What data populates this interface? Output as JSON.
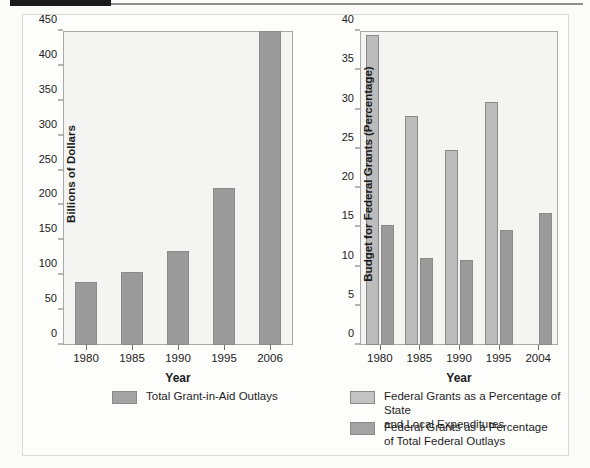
{
  "figure": {
    "background_color": "#fdfdfc",
    "bar_light_color": "#bcbcbc",
    "bar_dark_color": "#9b9b9b"
  },
  "chart_data": [
    {
      "id": "left",
      "type": "bar",
      "title": "",
      "xlabel": "Year",
      "ylabel": "Billions of Dollars",
      "categories": [
        "1980",
        "1985",
        "1990",
        "1995",
        "2006"
      ],
      "ylim": [
        0,
        450
      ],
      "yticks": [
        0,
        50,
        100,
        150,
        200,
        250,
        300,
        350,
        400,
        450
      ],
      "grid": false,
      "legend_position": "bottom",
      "series": [
        {
          "name": "Total Grant-in-Aid Outlays",
          "color": "#9b9b9b",
          "values": [
            91,
            105,
            135,
            225,
            450
          ]
        }
      ]
    },
    {
      "id": "right",
      "type": "bar",
      "title": "",
      "xlabel": "Year",
      "ylabel": "Budget for Federal Grants (Percentage)",
      "categories": [
        "1980",
        "1985",
        "1990",
        "1995",
        "2004"
      ],
      "ylim": [
        0,
        40
      ],
      "yticks": [
        0,
        5,
        10,
        15,
        20,
        25,
        30,
        35,
        40
      ],
      "grid": false,
      "legend_position": "bottom",
      "series": [
        {
          "name": "Federal Grants as a Percentage of State and Local Expenditures",
          "color": "#bcbcbc",
          "values": [
            39.5,
            29.2,
            24.9,
            31.0,
            null
          ]
        },
        {
          "name": "Federal Grants as a Percentage of Total Federal Outlays",
          "color": "#9b9b9b",
          "values": [
            15.3,
            11.1,
            10.8,
            14.7,
            16.8
          ]
        }
      ]
    }
  ],
  "legends": {
    "left": [
      {
        "swatch": "dark",
        "line1": "Total Grant-in-Aid Outlays",
        "line2": ""
      }
    ],
    "right": [
      {
        "swatch": "light",
        "line1": "Federal Grants as a Percentage of State",
        "line2": "and Local Expenditures"
      },
      {
        "swatch": "dark",
        "line1": "Federal Grants as a Percentage",
        "line2": "of Total Federal Outlays"
      }
    ]
  }
}
